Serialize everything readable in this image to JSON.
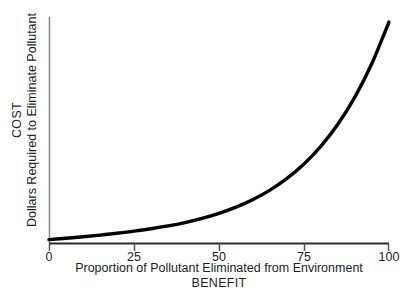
{
  "chart_data": {
    "type": "line",
    "title": "",
    "xlabel": "Proportion of Pollutant Eliminated from Environment",
    "xlabel_secondary": "BENEFIT",
    "ylabel": "Dollars Required to Eliminate Pollutant",
    "ylabel_secondary": "COST",
    "xlim": [
      0,
      100
    ],
    "ylim": [
      0,
      100
    ],
    "xticks": [
      "0",
      "25",
      "50",
      "75",
      "100"
    ],
    "xtick_values": [
      0,
      25,
      50,
      75,
      100
    ],
    "yticks": [],
    "grid": false,
    "legend": false,
    "series": [
      {
        "name": "Cost of pollutant elimination",
        "color": "#000000",
        "line_width": 3.4,
        "x": [
          0,
          5,
          10,
          15,
          20,
          25,
          30,
          35,
          40,
          45,
          50,
          55,
          60,
          65,
          70,
          75,
          80,
          85,
          90,
          95,
          100
        ],
        "values": [
          1,
          1.7,
          2.5,
          3.4,
          4.4,
          5.5,
          6.8,
          8.3,
          10.1,
          12.3,
          15.0,
          18.3,
          22.4,
          27.4,
          33.6,
          41.3,
          50.8,
          62.6,
          77.1,
          95.0,
          117.0
        ]
      }
    ],
    "annotations": [],
    "axis_color_y": "#8d8d8d",
    "axis_color_x": "#2b2b2b",
    "background": "#ffffff"
  },
  "xaxis": {
    "ticks": [
      {
        "label": "0"
      },
      {
        "label": "25"
      },
      {
        "label": "50"
      },
      {
        "label": "75"
      },
      {
        "label": "100"
      }
    ],
    "title_main": "Proportion of Pollutant Eliminated from Environment",
    "title_sub": "BENEFIT"
  },
  "yaxis": {
    "title_main": "Dollars Required to Eliminate Pollutant",
    "title_sub": "COST"
  }
}
